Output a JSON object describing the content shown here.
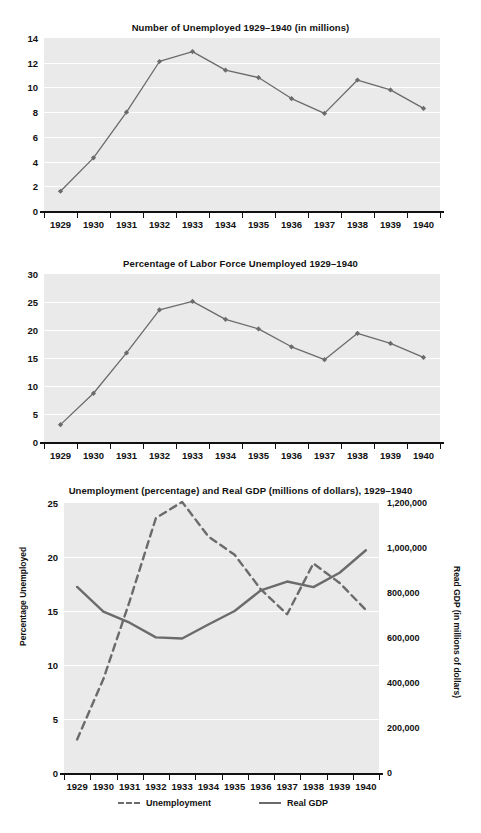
{
  "document": {
    "kind": "textbook-figure-page",
    "figure_count": 3
  },
  "charts": [
    {
      "id": "chart-unemployed-millions",
      "title": "Number of Unemployed 1929–1940 (in millions)",
      "ylabel": "",
      "yticks": [
        "0",
        "2",
        "4",
        "6",
        "8",
        "10",
        "12",
        "14"
      ],
      "xticks": [
        "1929",
        "1930",
        "1931",
        "1932",
        "1933",
        "1934",
        "1935",
        "1936",
        "1937",
        "1938",
        "1939",
        "1940"
      ]
    },
    {
      "id": "chart-percent-labor-force",
      "title": "Percentage of Labor Force Unemployed 1929–1940",
      "ylabel": "",
      "yticks": [
        "0",
        "5",
        "10",
        "15",
        "20",
        "25",
        "30"
      ],
      "xticks": [
        "1929",
        "1930",
        "1931",
        "1932",
        "1933",
        "1934",
        "1935",
        "1936",
        "1937",
        "1938",
        "1939",
        "1940"
      ]
    },
    {
      "id": "chart-unemployment-and-gdp",
      "title": "Unemployment (percentage) and Real GDP (millions of dollars), 1929–1940",
      "ylabel_left": "Percentage Unemployed",
      "ylabel_right": "Read GDP (in millions of dollars)",
      "yticks_left": [
        "0",
        "5",
        "10",
        "15",
        "20",
        "25"
      ],
      "yticks_right": [
        "0",
        "200,000",
        "400,000",
        "600,000",
        "800,000",
        "1,000,000",
        "1,200,000"
      ],
      "xticks": [
        "1929",
        "1930",
        "1931",
        "1932",
        "1933",
        "1934",
        "1935",
        "1936",
        "1937",
        "1938",
        "1939",
        "1940"
      ],
      "legend": [
        {
          "label": "Unemployment",
          "style": "dashed"
        },
        {
          "label": "Real GDP",
          "style": "solid"
        }
      ]
    }
  ],
  "chart_data": [
    {
      "type": "line",
      "title": "Number of Unemployed 1929–1940 (in millions)",
      "xlabel": "",
      "ylabel": "",
      "categories": [
        "1929",
        "1930",
        "1931",
        "1932",
        "1933",
        "1934",
        "1935",
        "1936",
        "1937",
        "1938",
        "1939",
        "1940"
      ],
      "values": [
        1.6,
        4.3,
        8.0,
        12.1,
        12.9,
        11.4,
        10.8,
        9.1,
        7.9,
        10.6,
        9.8,
        8.3
      ],
      "ylim": [
        0,
        14
      ],
      "ytick_step": 2,
      "grid": true,
      "markers": true,
      "line_color": "#6b6b6b",
      "plot_background": "#eaeaea"
    },
    {
      "type": "line",
      "title": "Percentage of Labor Force Unemployed 1929–1940",
      "xlabel": "",
      "ylabel": "",
      "categories": [
        "1929",
        "1930",
        "1931",
        "1932",
        "1933",
        "1934",
        "1935",
        "1936",
        "1937",
        "1938",
        "1939",
        "1940"
      ],
      "values": [
        3.1,
        8.7,
        15.9,
        23.6,
        25.1,
        21.9,
        20.2,
        17.0,
        14.7,
        19.4,
        17.6,
        15.1
      ],
      "ylim": [
        0,
        30
      ],
      "ytick_step": 5,
      "grid": true,
      "markers": true,
      "line_color": "#6b6b6b",
      "plot_background": "#eaeaea"
    },
    {
      "type": "line",
      "title": "Unemployment (percentage) and Real GDP (millions of dollars), 1929–1940",
      "categories": [
        "1929",
        "1930",
        "1931",
        "1932",
        "1933",
        "1934",
        "1935",
        "1936",
        "1937",
        "1938",
        "1939",
        "1940"
      ],
      "xlabel": "",
      "ylabel": "Percentage Unemployed",
      "ylabel_secondary": "Read GDP (in millions of dollars)",
      "ylim": [
        0,
        25
      ],
      "ylim_secondary": [
        0,
        1200000
      ],
      "ytick_step": 5,
      "ytick_step_secondary": 200000,
      "grid": true,
      "markers": false,
      "legend_position": "bottom",
      "series": [
        {
          "name": "Unemployment",
          "axis": "left",
          "style": "dashed",
          "color": "#6b6b6b",
          "values": [
            3.1,
            8.7,
            15.9,
            23.6,
            25.1,
            21.9,
            20.2,
            17.0,
            14.7,
            19.4,
            17.6,
            15.1
          ]
        },
        {
          "name": "Real GDP",
          "axis": "right",
          "style": "solid",
          "color": "#6b6b6b",
          "values": [
            827000,
            717000,
            668000,
            603000,
            598000,
            660000,
            720000,
            812000,
            851000,
            826000,
            890000,
            990000
          ]
        }
      ]
    }
  ]
}
